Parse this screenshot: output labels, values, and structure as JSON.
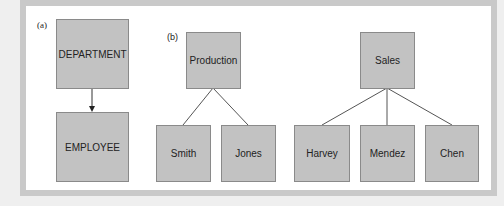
{
  "panel_a": {
    "label": "(a)",
    "parent": "DEPARTMENT",
    "child": "EMPLOYEE"
  },
  "panel_b": {
    "label": "(b)",
    "trees": [
      {
        "parent": "Production",
        "children": [
          "Smith",
          "Jones"
        ]
      },
      {
        "parent": "Sales",
        "children": [
          "Harvey",
          "Mendez",
          "Chen"
        ]
      }
    ]
  },
  "colors": {
    "box_fill": "#c2c2c2",
    "border": "#8a8a8a",
    "frame": "#c9c9c9"
  }
}
